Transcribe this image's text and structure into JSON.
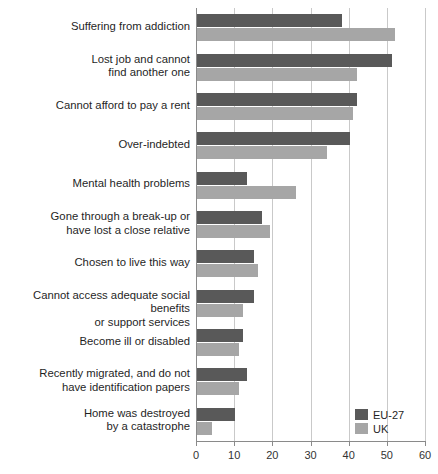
{
  "chart_data": {
    "type": "bar",
    "orientation": "horizontal",
    "title": "",
    "xlabel": "",
    "ylabel": "",
    "xlim": [
      0,
      60
    ],
    "xticks": [
      0,
      10,
      20,
      30,
      40,
      50,
      60
    ],
    "grid": true,
    "legend_position": "bottom-right",
    "categories": [
      "Suffering from addiction",
      "Lost job and cannot\nfind another one",
      "Cannot afford to pay a rent",
      "Over-indebted",
      "Mental health problems",
      "Gone through a break-up or\nhave lost a close relative",
      "Chosen to live this way",
      "Cannot access adequate social benefits\nor support services",
      "Become ill or disabled",
      "Recently migrated, and do not\nhave identification papers",
      "Home was destroyed\nby a catastrophe"
    ],
    "series": [
      {
        "name": "EU-27",
        "color": "#595959",
        "values": [
          38,
          51,
          42,
          40,
          13,
          17,
          15,
          15,
          12,
          13,
          10
        ]
      },
      {
        "name": "UK",
        "color": "#a6a6a6",
        "values": [
          52,
          42,
          41,
          34,
          26,
          19,
          16,
          12,
          11,
          11,
          4
        ]
      }
    ]
  },
  "legend": {
    "items": [
      {
        "label": "EU-27",
        "color": "#595959"
      },
      {
        "label": "UK",
        "color": "#a6a6a6"
      }
    ]
  },
  "axis": {
    "tick_labels": [
      "0",
      "10",
      "20",
      "30",
      "40",
      "50",
      "60"
    ]
  }
}
